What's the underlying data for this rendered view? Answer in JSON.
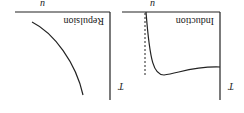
{
  "orientation": "rotated-180",
  "panels": [
    {
      "title": "Repulsion",
      "x_axis_label": "T",
      "y_axis_label": "u",
      "curve": "monotonically increasing curve, steep at high T"
    },
    {
      "title": "Induction",
      "x_axis_label": "T",
      "y_axis_label": "u",
      "curve": "sharp rise near asymptote (dashed line) then minimum and plateau"
    }
  ],
  "colors": {
    "line": "#222222",
    "background": "#ffffff"
  }
}
